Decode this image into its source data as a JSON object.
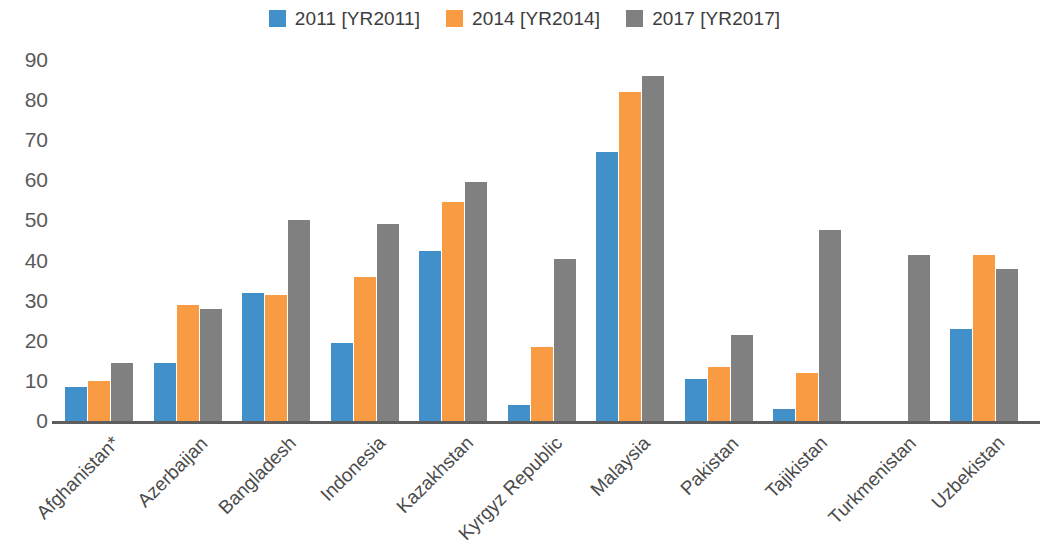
{
  "chart_data": {
    "type": "bar",
    "title": "",
    "subtitle": "",
    "xlabel": "",
    "ylabel": "",
    "grid": false,
    "legend_position": "top-center",
    "ylim": [
      0,
      90
    ],
    "yticks": [
      0,
      10,
      20,
      30,
      40,
      50,
      60,
      70,
      80,
      90
    ],
    "categories": [
      "Afghanistan*",
      "Azerbaijan",
      "Bangladesh",
      "Indonesia",
      "Kazakhstan",
      "Kyrgyz Republic",
      "Malaysia",
      "Pakistan",
      "Tajikistan",
      "Turkmenistan",
      "Uzbekistan"
    ],
    "series": [
      {
        "name": "2011 [YR2011]",
        "color": "#4290C9",
        "values": [
          8.5,
          14.5,
          32,
          19.5,
          42.5,
          4,
          67,
          10.5,
          3,
          null,
          23
        ]
      },
      {
        "name": "2014 [YR2014]",
        "color": "#F89B43",
        "values": [
          10,
          29,
          31.5,
          36,
          54.5,
          18.5,
          82,
          13.5,
          12,
          null,
          41.5
        ]
      },
      {
        "name": "2017 [YR2017]",
        "color": "#808080",
        "values": [
          14.5,
          28,
          50,
          49,
          59.5,
          40.5,
          86,
          21.5,
          47.5,
          41.5,
          38
        ]
      }
    ]
  },
  "legend": {
    "items": [
      {
        "label": "2011 [YR2011]",
        "color": "#4290C9"
      },
      {
        "label": "2014 [YR2014]",
        "color": "#F89B43"
      },
      {
        "label": "2017 [YR2017]",
        "color": "#808080"
      }
    ]
  }
}
